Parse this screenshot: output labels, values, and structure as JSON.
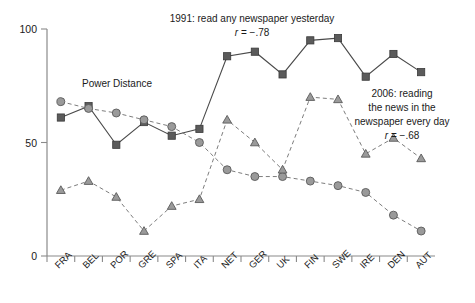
{
  "chart_data": {
    "type": "line",
    "title": "",
    "xlabel": "",
    "ylabel": "",
    "ylim": [
      0,
      100
    ],
    "yticks": [
      0,
      50,
      100
    ],
    "ytick_labels": [
      "0",
      "50",
      "100"
    ],
    "grid": false,
    "legend_position": "inline-annotations",
    "categories": [
      "FRA",
      "BEL",
      "POR",
      "GRE",
      "SPA",
      "ITA",
      "NET",
      "GER",
      "UK",
      "FIN",
      "SWE",
      "IRE",
      "DEN",
      "AUT"
    ],
    "series": [
      {
        "name": "1991: read any newspaper yesterday",
        "marker": "square",
        "line": "solid",
        "color": "#5b5b5b",
        "values": [
          61,
          66,
          49,
          59,
          53,
          56,
          88,
          90,
          80,
          95,
          96,
          79,
          89,
          81
        ]
      },
      {
        "name": "Power Distance",
        "marker": "circle",
        "line": "dashed",
        "color": "#9a9a9a",
        "values": [
          68,
          65,
          63,
          60,
          57,
          50,
          38,
          35,
          35,
          33,
          31,
          28,
          18,
          11
        ]
      },
      {
        "name": "2006: reading the news in the newspaper every day",
        "marker": "triangle",
        "line": "dashed",
        "color": "#9a9a9a",
        "values": [
          29,
          33,
          26,
          11,
          22,
          25,
          60,
          50,
          38,
          70,
          69,
          45,
          52,
          43
        ]
      }
    ],
    "annotations": [
      {
        "id": "series-1991-label",
        "lines": [
          "1991: read any newspaper yesterday"
        ],
        "stat_label": "r",
        "stat_value": "= −.78",
        "x": 252,
        "y": 22,
        "align": "middle"
      },
      {
        "id": "power-distance-label",
        "lines": [
          "Power Distance"
        ],
        "stat_label": "",
        "stat_value": "",
        "x": 117,
        "y": 87,
        "align": "middle"
      },
      {
        "id": "series-2006-label",
        "lines": [
          "2006: reading",
          "the news in the",
          "newspaper every day"
        ],
        "stat_label": "r",
        "stat_value": "= −.68",
        "x": 402,
        "y": 93,
        "align": "middle"
      }
    ]
  }
}
